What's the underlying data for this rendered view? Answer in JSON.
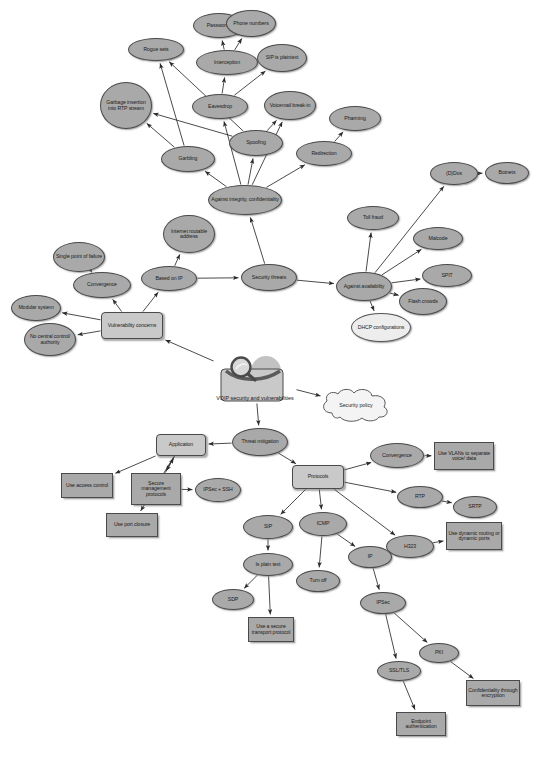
{
  "figure": {
    "caption": "",
    "colors": {
      "node_fill": "#a9a9a9",
      "node_fill_light": "#ededed",
      "node_stroke": "#4a4a4a",
      "edge": "#2b2b2b",
      "background": "#ffffff",
      "center_box_fill": "#c9c9c9"
    }
  },
  "chart_data": {
    "type": "diagram",
    "layout": "directed concept map / mind map",
    "root": "VOIP security and vulnerabilities",
    "nodes": [
      {
        "id": "rogue_sets",
        "label": "Rogue sets",
        "shape": "ellipse",
        "x": 128,
        "y": 38,
        "w": 56,
        "h": 23
      },
      {
        "id": "passwords",
        "label": "Passwords",
        "shape": "ellipse",
        "x": 193,
        "y": 13,
        "w": 52,
        "h": 25
      },
      {
        "id": "phone_numbers",
        "label": "Phone numbers",
        "shape": "ellipse",
        "x": 226,
        "y": 10,
        "w": 50,
        "h": 27
      },
      {
        "id": "interception",
        "label": "Interception",
        "shape": "ellipse",
        "x": 196,
        "y": 50,
        "w": 62,
        "h": 25
      },
      {
        "id": "sip_is_plaintext",
        "label": "SIP is plaintext",
        "shape": "ellipse",
        "x": 257,
        "y": 44,
        "w": 50,
        "h": 28
      },
      {
        "id": "garbage_insertion",
        "label": "Garbage insertion into RTP stream",
        "shape": "ellipse",
        "x": 100,
        "y": 82,
        "w": 52,
        "h": 47
      },
      {
        "id": "eavesdrop",
        "label": "Eavesdrop",
        "shape": "ellipse",
        "x": 192,
        "y": 94,
        "w": 56,
        "h": 25
      },
      {
        "id": "voicemail_breakin",
        "label": "Voicemail break-in",
        "shape": "ellipse",
        "x": 264,
        "y": 91,
        "w": 52,
        "h": 29
      },
      {
        "id": "pharming",
        "label": "Pharming",
        "shape": "ellipse",
        "x": 329,
        "y": 106,
        "w": 52,
        "h": 25
      },
      {
        "id": "garbling",
        "label": "Garbling",
        "shape": "ellipse",
        "x": 161,
        "y": 146,
        "w": 54,
        "h": 26
      },
      {
        "id": "spoofing",
        "label": "Spoofing",
        "shape": "ellipse",
        "x": 229,
        "y": 130,
        "w": 54,
        "h": 26
      },
      {
        "id": "redirection",
        "label": "Redirection",
        "shape": "ellipse",
        "x": 296,
        "y": 141,
        "w": 56,
        "h": 25
      },
      {
        "id": "against_integrity",
        "label": "Against integrity, confidentiality",
        "shape": "ellipse",
        "x": 208,
        "y": 185,
        "w": 74,
        "h": 30
      },
      {
        "id": "internet_routable",
        "label": "Internet routable address",
        "shape": "ellipse",
        "x": 163,
        "y": 215,
        "w": 52,
        "h": 38
      },
      {
        "id": "single_point",
        "label": "Single point of failure",
        "shape": "ellipse",
        "x": 53,
        "y": 242,
        "w": 52,
        "h": 30
      },
      {
        "id": "convergence_vuln",
        "label": "Convergence",
        "shape": "ellipse",
        "x": 73,
        "y": 272,
        "w": 58,
        "h": 26
      },
      {
        "id": "based_on_ip",
        "label": "Based on IP",
        "shape": "ellipse",
        "x": 141,
        "y": 266,
        "w": 56,
        "h": 25
      },
      {
        "id": "security_threats",
        "label": "Security threats",
        "shape": "ellipse",
        "x": 241,
        "y": 264,
        "w": 56,
        "h": 27
      },
      {
        "id": "toll_fraud",
        "label": "Toll fraud",
        "shape": "ellipse",
        "x": 347,
        "y": 206,
        "w": 52,
        "h": 24
      },
      {
        "id": "ddos",
        "label": "(D)Dos",
        "shape": "ellipse",
        "x": 430,
        "y": 162,
        "w": 48,
        "h": 23
      },
      {
        "id": "botnets",
        "label": "Botnets",
        "shape": "ellipse",
        "x": 485,
        "y": 162,
        "w": 44,
        "h": 22
      },
      {
        "id": "malcode",
        "label": "Malcode",
        "shape": "ellipse",
        "x": 413,
        "y": 227,
        "w": 50,
        "h": 23
      },
      {
        "id": "spit",
        "label": "SPIT",
        "shape": "ellipse",
        "x": 422,
        "y": 264,
        "w": 50,
        "h": 23
      },
      {
        "id": "flash_crowds",
        "label": "Flash crowds",
        "shape": "ellipse",
        "x": 399,
        "y": 288,
        "w": 48,
        "h": 27
      },
      {
        "id": "against_availability",
        "label": "Against availability",
        "shape": "ellipse",
        "x": 336,
        "y": 272,
        "w": 56,
        "h": 29
      },
      {
        "id": "dhcp_configurations",
        "label": "DHCP configurations",
        "shape": "ellipse",
        "x": 351,
        "y": 313,
        "w": 60,
        "h": 29,
        "fill": "light"
      },
      {
        "id": "modular_system",
        "label": "Modular system",
        "shape": "ellipse",
        "x": 11,
        "y": 295,
        "w": 50,
        "h": 26
      },
      {
        "id": "no_central_control",
        "label": "No central control/ authority",
        "shape": "ellipse",
        "x": 24,
        "y": 323,
        "w": 52,
        "h": 33
      },
      {
        "id": "vulnerability_concerns",
        "label": "Vulnerability concerns",
        "shape": "rrect",
        "x": 101,
        "y": 312,
        "w": 62,
        "h": 27
      },
      {
        "id": "voip_center",
        "label": "VOIP security and vulnerabilities",
        "shape": "center",
        "x": 214,
        "y": 355,
        "w": 82,
        "h": 48
      },
      {
        "id": "security_policy",
        "label": "Security policy",
        "shape": "cloud",
        "x": 318,
        "y": 388,
        "w": 76,
        "h": 34
      },
      {
        "id": "threat_mitigation",
        "label": "Threat mitigation",
        "shape": "ellipse",
        "x": 232,
        "y": 428,
        "w": 56,
        "h": 28
      },
      {
        "id": "application",
        "label": "Application",
        "shape": "rrect",
        "x": 156,
        "y": 434,
        "w": 50,
        "h": 22
      },
      {
        "id": "protocols",
        "label": "Protocols",
        "shape": "rrect",
        "x": 292,
        "y": 465,
        "w": 52,
        "h": 24
      },
      {
        "id": "convergence_proto",
        "label": "Convergence",
        "shape": "ellipse",
        "x": 370,
        "y": 443,
        "w": 54,
        "h": 25
      },
      {
        "id": "use_vlans",
        "label": "Use VLANs to separate voice/ data",
        "shape": "rect",
        "x": 434,
        "y": 442,
        "w": 60,
        "h": 28
      },
      {
        "id": "use_access_control",
        "label": "Use access control",
        "shape": "rect",
        "x": 61,
        "y": 473,
        "w": 52,
        "h": 25
      },
      {
        "id": "secure_mgmt_protocols",
        "label": "Secure management protocols",
        "shape": "rect",
        "x": 131,
        "y": 473,
        "w": 50,
        "h": 32
      },
      {
        "id": "ipsec_ssh",
        "label": "IPSec + SSH",
        "shape": "ellipse",
        "x": 195,
        "y": 478,
        "w": 46,
        "h": 24
      },
      {
        "id": "use_port_closure",
        "label": "Use port closure",
        "shape": "rect",
        "x": 106,
        "y": 513,
        "w": 52,
        "h": 24
      },
      {
        "id": "rtp",
        "label": "RTP",
        "shape": "ellipse",
        "x": 397,
        "y": 486,
        "w": 46,
        "h": 22
      },
      {
        "id": "srtp",
        "label": "SRTP",
        "shape": "ellipse",
        "x": 453,
        "y": 496,
        "w": 44,
        "h": 22
      },
      {
        "id": "sip",
        "label": "SIP",
        "shape": "ellipse",
        "x": 243,
        "y": 515,
        "w": 50,
        "h": 24
      },
      {
        "id": "icmp",
        "label": "ICMP",
        "shape": "ellipse",
        "x": 299,
        "y": 512,
        "w": 48,
        "h": 24
      },
      {
        "id": "h323",
        "label": "H323",
        "shape": "ellipse",
        "x": 386,
        "y": 535,
        "w": 48,
        "h": 23
      },
      {
        "id": "use_dynamic_routing",
        "label": "Use dynamic routing or dynamic ports",
        "shape": "rect",
        "x": 446,
        "y": 522,
        "w": 56,
        "h": 28
      },
      {
        "id": "ip",
        "label": "IP",
        "shape": "ellipse",
        "x": 348,
        "y": 546,
        "w": 44,
        "h": 22
      },
      {
        "id": "is_plain_text",
        "label": "Is plain text",
        "shape": "ellipse",
        "x": 243,
        "y": 553,
        "w": 50,
        "h": 23
      },
      {
        "id": "turn_off",
        "label": "Turn off",
        "shape": "ellipse",
        "x": 296,
        "y": 570,
        "w": 44,
        "h": 22
      },
      {
        "id": "ipsec",
        "label": "IPSec",
        "shape": "ellipse",
        "x": 360,
        "y": 592,
        "w": 46,
        "h": 22
      },
      {
        "id": "sdp",
        "label": "SDP",
        "shape": "ellipse",
        "x": 212,
        "y": 589,
        "w": 42,
        "h": 21
      },
      {
        "id": "use_secure_transport",
        "label": "Use a secure transport protocol",
        "shape": "rect",
        "x": 248,
        "y": 617,
        "w": 46,
        "h": 25
      },
      {
        "id": "pki",
        "label": "PKI",
        "shape": "ellipse",
        "x": 419,
        "y": 643,
        "w": 40,
        "h": 20
      },
      {
        "id": "ssl_tls",
        "label": "SSL/TLS",
        "shape": "ellipse",
        "x": 377,
        "y": 661,
        "w": 44,
        "h": 20
      },
      {
        "id": "confidentiality_enc",
        "label": "Confidentiality through encryption",
        "shape": "rect",
        "x": 466,
        "y": 680,
        "w": 54,
        "h": 26
      },
      {
        "id": "endpoint_auth",
        "label": "Endpoint authentication",
        "shape": "rect",
        "x": 396,
        "y": 712,
        "w": 50,
        "h": 24
      }
    ],
    "edges": [
      [
        "voip_center",
        "vulnerability_concerns"
      ],
      [
        "voip_center",
        "security_policy"
      ],
      [
        "voip_center",
        "threat_mitigation"
      ],
      [
        "vulnerability_concerns",
        "convergence_vuln"
      ],
      [
        "vulnerability_concerns",
        "based_on_ip"
      ],
      [
        "vulnerability_concerns",
        "modular_system"
      ],
      [
        "vulnerability_concerns",
        "no_central_control"
      ],
      [
        "convergence_vuln",
        "single_point"
      ],
      [
        "based_on_ip",
        "internet_routable"
      ],
      [
        "based_on_ip",
        "security_threats"
      ],
      [
        "security_threats",
        "against_integrity"
      ],
      [
        "security_threats",
        "against_availability"
      ],
      [
        "against_integrity",
        "garbling"
      ],
      [
        "against_integrity",
        "spoofing"
      ],
      [
        "against_integrity",
        "eavesdrop"
      ],
      [
        "against_integrity",
        "redirection"
      ],
      [
        "against_integrity",
        "voicemail_breakin"
      ],
      [
        "garbling",
        "rogue_sets"
      ],
      [
        "garbling",
        "garbage_insertion"
      ],
      [
        "spoofing",
        "garbage_insertion"
      ],
      [
        "spoofing",
        "rogue_sets"
      ],
      [
        "spoofing",
        "voicemail_breakin"
      ],
      [
        "eavesdrop",
        "interception"
      ],
      [
        "eavesdrop",
        "sip_is_plaintext"
      ],
      [
        "interception",
        "passwords"
      ],
      [
        "interception",
        "phone_numbers"
      ],
      [
        "redirection",
        "pharming"
      ],
      [
        "against_availability",
        "toll_fraud"
      ],
      [
        "against_availability",
        "ddos"
      ],
      [
        "against_availability",
        "malcode"
      ],
      [
        "against_availability",
        "spit"
      ],
      [
        "against_availability",
        "flash_crowds"
      ],
      [
        "against_availability",
        "dhcp_configurations"
      ],
      [
        "ddos",
        "botnets"
      ],
      [
        "threat_mitigation",
        "application"
      ],
      [
        "threat_mitigation",
        "protocols"
      ],
      [
        "application",
        "use_access_control"
      ],
      [
        "application",
        "secure_mgmt_protocols"
      ],
      [
        "application",
        "use_port_closure"
      ],
      [
        "secure_mgmt_protocols",
        "ipsec_ssh"
      ],
      [
        "secure_mgmt_protocols",
        "application"
      ],
      [
        "protocols",
        "convergence_proto"
      ],
      [
        "protocols",
        "rtp"
      ],
      [
        "protocols",
        "h323"
      ],
      [
        "protocols",
        "sip"
      ],
      [
        "protocols",
        "icmp"
      ],
      [
        "convergence_proto",
        "use_vlans"
      ],
      [
        "rtp",
        "srtp"
      ],
      [
        "h323",
        "use_dynamic_routing"
      ],
      [
        "sip",
        "is_plain_text"
      ],
      [
        "is_plain_text",
        "sdp"
      ],
      [
        "is_plain_text",
        "use_secure_transport"
      ],
      [
        "icmp",
        "turn_off"
      ],
      [
        "icmp",
        "ip"
      ],
      [
        "ip",
        "ipsec"
      ],
      [
        "ipsec",
        "ssl_tls"
      ],
      [
        "ipsec",
        "pki"
      ],
      [
        "ssl_tls",
        "endpoint_auth"
      ],
      [
        "pki",
        "confidentiality_enc"
      ]
    ]
  }
}
